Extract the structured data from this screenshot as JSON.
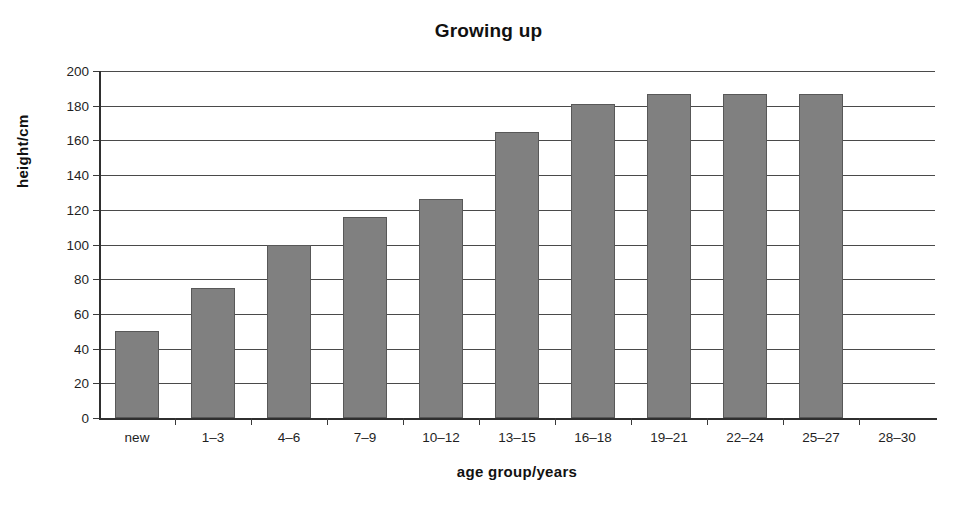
{
  "chart_data": {
    "type": "bar",
    "title": "Growing up",
    "xlabel": "age group/years",
    "ylabel": "height/cm",
    "categories": [
      "new",
      "1–3",
      "4–6",
      "7–9",
      "10–12",
      "13–15",
      "16–18",
      "19–21",
      "22–24",
      "25–27",
      "28–30"
    ],
    "values": [
      50,
      75,
      100,
      116,
      126,
      165,
      181,
      187,
      187,
      187,
      null
    ],
    "ylim": [
      0,
      200
    ],
    "ytick_labels": [
      "0",
      "20",
      "40",
      "60",
      "80",
      "100",
      "120",
      "140",
      "160",
      "180",
      "200"
    ],
    "ytick_values": [
      0,
      20,
      40,
      60,
      80,
      100,
      120,
      140,
      160,
      180,
      200
    ],
    "grid": "horizontal",
    "legend": "none",
    "bar_color": "#808080",
    "bar_edge_color": "#585858",
    "axis_color": "#2f2f2f",
    "gridline_color": "#4a4a4a",
    "text_color": "#1a1a1a"
  }
}
